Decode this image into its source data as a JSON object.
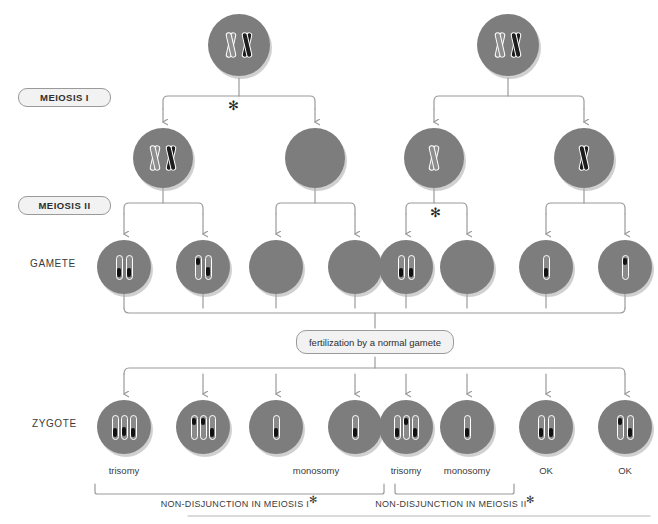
{
  "diagram": {
    "colors": {
      "cell_fill": "#7d7d7d",
      "cell_shadow": "#aaaaaa",
      "chromosome_outline": "#ffffff",
      "chromosome_dark": "#1d1d1d",
      "chromosome_light": "#8e8e8e",
      "connector": "#9a9a9a",
      "pill_fill": "#f2f2f2",
      "text": "#3b3b3b"
    }
  },
  "stage_labels": {
    "meiosis_i": "MEIOSIS I",
    "meiosis_ii": "MEIOSIS II",
    "gamete": "GAMETE",
    "zygote": "ZYGOTE"
  },
  "markers": {
    "nondisjunction_star": "✻"
  },
  "parents": [
    {
      "id": "parent-left",
      "chromosomes": [
        "light",
        "dark"
      ]
    },
    {
      "id": "parent-right",
      "chromosomes": [
        "light",
        "dark"
      ]
    }
  ],
  "meiosis_i_cells": [
    {
      "id": "mi-1",
      "chromosomes": [
        "light",
        "dark"
      ],
      "note": "both homologues - non-disjunction"
    },
    {
      "id": "mi-2",
      "chromosomes": [],
      "note": "empty"
    },
    {
      "id": "mi-3",
      "chromosomes": [
        "light"
      ],
      "note": "normal separation"
    },
    {
      "id": "mi-4",
      "chromosomes": [
        "dark"
      ],
      "note": "normal separation"
    }
  ],
  "gametes": [
    {
      "id": "gamete-1",
      "chromatids": [
        "light",
        "dark"
      ]
    },
    {
      "id": "gamete-2",
      "chromatids": [
        "dark",
        "light"
      ]
    },
    {
      "id": "gamete-3",
      "chromatids": []
    },
    {
      "id": "gamete-4",
      "chromatids": []
    },
    {
      "id": "gamete-5",
      "chromatids": [
        "light",
        "light"
      ]
    },
    {
      "id": "gamete-6",
      "chromatids": []
    },
    {
      "id": "gamete-7",
      "chromatids": [
        "light"
      ]
    },
    {
      "id": "gamete-8",
      "chromatids": [
        "dark"
      ]
    }
  ],
  "fertilization": {
    "label": "fertilization by a normal gamete"
  },
  "zygotes": [
    {
      "id": "zygote-1",
      "chromatids": [
        "light",
        "dark",
        "light"
      ],
      "outcome": "trisomy"
    },
    {
      "id": "zygote-2",
      "chromatids": [
        "dark",
        "dark",
        "light"
      ],
      "outcome": "trisomy"
    },
    {
      "id": "zygote-3",
      "chromatids": [
        "light"
      ],
      "outcome": "monosomy"
    },
    {
      "id": "zygote-4",
      "chromatids": [
        "light"
      ],
      "outcome": "monosomy"
    },
    {
      "id": "zygote-5",
      "chromatids": [
        "light",
        "dark",
        "light"
      ],
      "outcome": "trisomy"
    },
    {
      "id": "zygote-6",
      "chromatids": [
        "light"
      ],
      "outcome": "monosomy"
    },
    {
      "id": "zygote-7",
      "chromatids": [
        "light",
        "light"
      ],
      "outcome": "OK"
    },
    {
      "id": "zygote-8",
      "chromatids": [
        "dark",
        "light"
      ],
      "outcome": "OK"
    }
  ],
  "outcome_labels": [
    "trisomy",
    "monosomy",
    "trisomy",
    "monosomy",
    "OK",
    "OK"
  ],
  "group_captions": [
    {
      "id": "group-meiosis-i",
      "text": "NON-DISJUNCTION IN MEIOSIS I",
      "star": "✻"
    },
    {
      "id": "group-meiosis-ii",
      "text": "NON-DISJUNCTION IN MEIOSIS II",
      "star": "✻"
    }
  ]
}
